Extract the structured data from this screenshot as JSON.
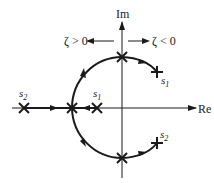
{
  "diagram": {
    "axes": {
      "real_label": "Re",
      "imag_label": "Im"
    },
    "direction_labels": {
      "left": "ζ > 0",
      "right": "ζ < 0"
    },
    "points": [
      {
        "id": "s2-real",
        "label": "s",
        "sub": "2",
        "marker": "x",
        "location": "negative real axis, far left"
      },
      {
        "id": "s1-real",
        "label": "s",
        "sub": "1",
        "marker": "x",
        "location": "negative real axis, near origin"
      },
      {
        "id": "breakaway",
        "label": "",
        "marker": "x",
        "location": "real axis breakaway point"
      },
      {
        "id": "top-imag",
        "label": "",
        "marker": "x",
        "location": "positive imaginary axis"
      },
      {
        "id": "bottom-imag",
        "label": "",
        "marker": "x",
        "location": "negative imaginary axis"
      },
      {
        "id": "s1-rhp",
        "label": "s",
        "sub": "1",
        "marker": "+",
        "location": "right half plane, upper"
      },
      {
        "id": "s2-rhp",
        "label": "s",
        "sub": "2",
        "marker": "+",
        "location": "right half plane, lower"
      }
    ],
    "colors": {
      "ink": "#1a1a1a",
      "background": "#ffffff"
    }
  }
}
